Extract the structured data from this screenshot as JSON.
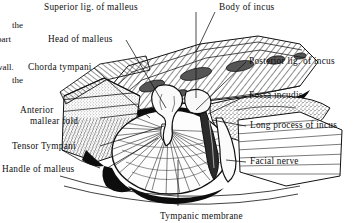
{
  "figure": {
    "style": "black-and-white line engraving with hatching and stipple",
    "ink_color": "#111111",
    "background_color": "#ffffff"
  },
  "column_fragments": [
    {
      "text": "the",
      "x": 12,
      "y": 20
    },
    {
      "text": "part",
      "x": 5,
      "y": 34
    },
    {
      "text": "wall.",
      "x": 2,
      "y": 62
    },
    {
      "text": "the",
      "x": 12,
      "y": 75
    }
  ],
  "labels": [
    {
      "id": "superior-ligament-of-malleus",
      "text": "Superior lig. of malleus",
      "x": 44,
      "y": 2,
      "side": "top"
    },
    {
      "id": "body-of-incus",
      "text": "Body of incus",
      "x": 219,
      "y": 2,
      "side": "top-right"
    },
    {
      "id": "head-of-malleus",
      "text": "Head of malleus",
      "x": 48,
      "y": 34,
      "side": "left"
    },
    {
      "id": "posterior-ligament-of-incus",
      "text": "Posterior lig. of incus",
      "x": 249,
      "y": 56,
      "side": "right"
    },
    {
      "id": "chorda-tympani",
      "text": "Chorda tympani",
      "x": 28,
      "y": 62,
      "side": "left"
    },
    {
      "id": "fossa-incudis",
      "text": "Fossa incudis",
      "x": 249,
      "y": 90,
      "side": "right"
    },
    {
      "id": "anterior-mallear-fold-line1",
      "text": "Anterior",
      "x": 20,
      "y": 105,
      "side": "left"
    },
    {
      "id": "anterior-mallear-fold-line2",
      "text": "mallear fold",
      "x": 30,
      "y": 116,
      "side": "left"
    },
    {
      "id": "long-process-of-incus",
      "text": "Long process of incus",
      "x": 250,
      "y": 120,
      "side": "right"
    },
    {
      "id": "tensor-tympani",
      "text": "Tensor Tympani",
      "x": 12,
      "y": 141,
      "side": "left"
    },
    {
      "id": "facial-nerve",
      "text": "Facial nerve",
      "x": 250,
      "y": 156,
      "side": "right"
    },
    {
      "id": "handle-of-malleus",
      "text": "Handle of malleus",
      "x": 2,
      "y": 164,
      "side": "left"
    },
    {
      "id": "tympanic-membrane",
      "text": "Tympanic membrane",
      "x": 160,
      "y": 211,
      "side": "bottom"
    }
  ],
  "structures": [
    {
      "id": "tympanic-membrane",
      "name": "Tympanic membrane",
      "description": "large oval drum with radiating fibre striations"
    },
    {
      "id": "malleus",
      "name": "Malleus",
      "description": "head, neck and handle descending onto the drum"
    },
    {
      "id": "incus",
      "name": "Incus",
      "description": "body in the epitympanum with long process descending"
    },
    {
      "id": "facial-nerve-canal",
      "name": "Facial nerve canal",
      "description": "dark vertical canal right of the drum"
    },
    {
      "id": "tensor-tympani",
      "name": "Tensor tympani",
      "description": "muscle tendon entering anteriorly"
    },
    {
      "id": "temporal-bone",
      "name": "Temporal bone",
      "description": "surrounding cut bone shown hatched and stippled"
    }
  ]
}
